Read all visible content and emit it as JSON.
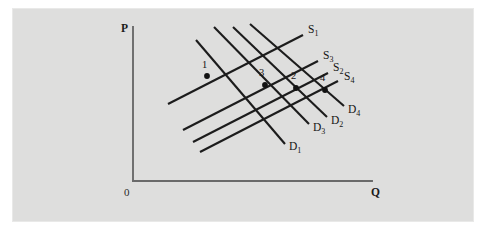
{
  "figure": {
    "background_color": "#dededd",
    "page_color": "#ffffff",
    "line_color": "#1c1c1c",
    "axis_color": "#6a6a6a"
  },
  "axes": {
    "y_label": "P",
    "x_label": "Q",
    "origin_label": "0",
    "y_axis": {
      "x": 133,
      "y_top": 27,
      "y_bottom": 181
    },
    "x_axis": {
      "y": 181,
      "x_left": 133,
      "x_right": 372
    },
    "y_label_pos": {
      "x": 121,
      "y": 32
    },
    "x_label_pos": {
      "x": 371,
      "y": 196
    },
    "origin_label_pos": {
      "x": 124,
      "y": 196
    }
  },
  "chart_data": {
    "type": "line",
    "xlabel": "Q",
    "ylabel": "P",
    "grid": false,
    "legend": "inline-end-labels",
    "axis_ranges": {
      "x": [
        0,
        1
      ],
      "y": [
        0,
        1
      ]
    },
    "supply_curves": [
      {
        "name": "S1",
        "label_text": "S",
        "label_sub": "1",
        "x1": 168,
        "y1": 104,
        "x2": 303,
        "y2": 35,
        "label_x": 308,
        "label_y": 33
      },
      {
        "name": "S3",
        "label_text": "S",
        "label_sub": "3",
        "x1": 183,
        "y1": 130,
        "x2": 318,
        "y2": 61,
        "label_x": 323,
        "label_y": 59
      },
      {
        "name": "S2",
        "label_text": "S",
        "label_sub": "2",
        "x1": 193,
        "y1": 142,
        "x2": 328,
        "y2": 73,
        "label_x": 333,
        "label_y": 71
      },
      {
        "name": "S4",
        "label_text": "S",
        "label_sub": "4",
        "x1": 200,
        "y1": 152,
        "x2": 338,
        "y2": 81,
        "label_x": 344,
        "label_y": 80
      }
    ],
    "demand_curves": [
      {
        "name": "D1",
        "label_text": "D",
        "label_sub": "1",
        "x1": 196,
        "y1": 40,
        "x2": 285,
        "y2": 144,
        "label_x": 289,
        "label_y": 150
      },
      {
        "name": "D3",
        "label_text": "D",
        "label_sub": "3",
        "x1": 214,
        "y1": 27,
        "x2": 309,
        "y2": 124,
        "label_x": 313,
        "label_y": 131
      },
      {
        "name": "D2",
        "label_text": "D",
        "label_sub": "2",
        "x1": 233,
        "y1": 27,
        "x2": 327,
        "y2": 117,
        "label_x": 331,
        "label_y": 124
      },
      {
        "name": "D4",
        "label_text": "D",
        "label_sub": "4",
        "x1": 250,
        "y1": 24,
        "x2": 344,
        "y2": 106,
        "label_x": 348,
        "label_y": 113
      }
    ],
    "equilibrium_points": [
      {
        "label": "1",
        "x": 207,
        "y": 76,
        "label_x": 202,
        "label_y": 68
      },
      {
        "label": "3",
        "x": 265,
        "y": 85,
        "label_x": 259,
        "label_y": 76
      },
      {
        "label": "2",
        "x": 296,
        "y": 88,
        "label_x": 291,
        "label_y": 79
      },
      {
        "label": "4",
        "x": 325,
        "y": 90,
        "label_x": 320,
        "label_y": 81
      }
    ]
  }
}
